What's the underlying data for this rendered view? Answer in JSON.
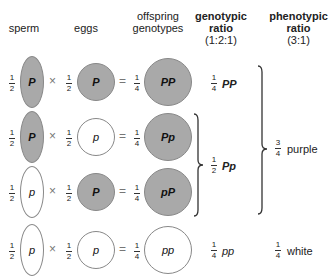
{
  "headers": {
    "sperm": "sperm",
    "eggs": "eggs",
    "offspring_line1": "offspring",
    "offspring_line2": "genotypes",
    "genotypic_line1": "genotypic",
    "genotypic_line2": "ratio",
    "genotypic_line3": "(1:2:1)",
    "phenotypic_line1": "phenotypic",
    "phenotypic_line2": "ratio",
    "phenotypic_line3": "(3:1)"
  },
  "symbols": {
    "times": "×",
    "equals": "="
  },
  "rows": [
    {
      "sperm_frac": {
        "num": "1",
        "den": "2"
      },
      "sperm_allele": "P",
      "sperm_fill": "filled",
      "egg_frac": {
        "num": "1",
        "den": "2"
      },
      "egg_allele": "P",
      "egg_fill": "filled",
      "off_frac": {
        "num": "1",
        "den": "4"
      },
      "off_genotype": "PP",
      "off_fill": "filled"
    },
    {
      "sperm_frac": {
        "num": "1",
        "den": "2"
      },
      "sperm_allele": "P",
      "sperm_fill": "filled",
      "egg_frac": {
        "num": "1",
        "den": "2"
      },
      "egg_allele": "p",
      "egg_fill": "empty",
      "off_frac": {
        "num": "1",
        "den": "4"
      },
      "off_genotype": "Pp",
      "off_fill": "filled"
    },
    {
      "sperm_frac": {
        "num": "1",
        "den": "2"
      },
      "sperm_allele": "p",
      "sperm_fill": "empty",
      "egg_frac": {
        "num": "1",
        "den": "2"
      },
      "egg_allele": "P",
      "egg_fill": "filled",
      "off_frac": {
        "num": "1",
        "den": "4"
      },
      "off_genotype": "pP",
      "off_fill": "filled"
    },
    {
      "sperm_frac": {
        "num": "1",
        "den": "2"
      },
      "sperm_allele": "p",
      "sperm_fill": "empty",
      "egg_frac": {
        "num": "1",
        "den": "2"
      },
      "egg_allele": "p",
      "egg_fill": "empty",
      "off_frac": {
        "num": "1",
        "den": "4"
      },
      "off_genotype": "pp",
      "off_fill": "empty"
    }
  ],
  "genotypic_ratios": [
    {
      "frac": {
        "num": "1",
        "den": "4"
      },
      "label": "PP"
    },
    {
      "frac": {
        "num": "1",
        "den": "2"
      },
      "label": "Pp"
    },
    {
      "frac": {
        "num": "1",
        "den": "4"
      },
      "label": "pp"
    }
  ],
  "phenotypic_ratios": [
    {
      "frac": {
        "num": "3",
        "den": "4"
      },
      "label": "purple"
    },
    {
      "frac": {
        "num": "1",
        "den": "4"
      },
      "label": "white"
    }
  ],
  "colors": {
    "filled": "#a9a9a9",
    "outline": "#888888",
    "bracket": "#333333"
  }
}
